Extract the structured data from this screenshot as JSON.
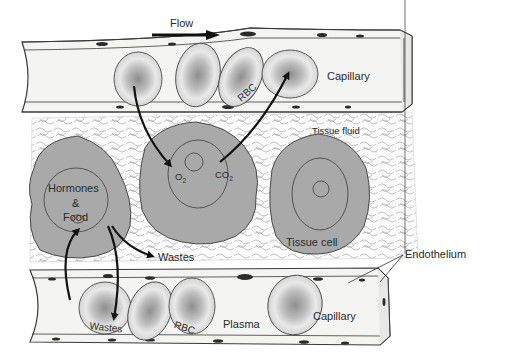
{
  "diagram": {
    "labels": {
      "flow": "Flow",
      "capillary_top": "Capillary",
      "rbc_top": "RBC",
      "tissue_fluid": "Tissue fluid",
      "o2": "O",
      "o2_sub": "2",
      "co2": "CO",
      "co2_sub": "2",
      "hormones_food_line1": "Hormones",
      "hormones_food_line2": "&",
      "hormones_food_line3": "Food",
      "wastes_mid": "Wastes",
      "tissue_cell": "Tissue cell",
      "endothelium": "Endothelium",
      "wastes_bottom": "Wastes",
      "rbc_bottom": "RBC",
      "plasma": "Plasma",
      "capillary_bottom": "Capillary"
    },
    "colors": {
      "cell_fill": "#a9a9a9",
      "cell_outline": "#4a4a4a",
      "vessel_fill": "#f4f4f2",
      "vessel_outline": "#3a3a3a",
      "nucleus_dark": "#2b2b2b",
      "rbc_fill": "#e4e4e4",
      "rbc_center": "#9a9a9a",
      "arrow": "#111111",
      "tissue_fluid_line": "#8a8a8a",
      "background": "#ffffff"
    }
  }
}
